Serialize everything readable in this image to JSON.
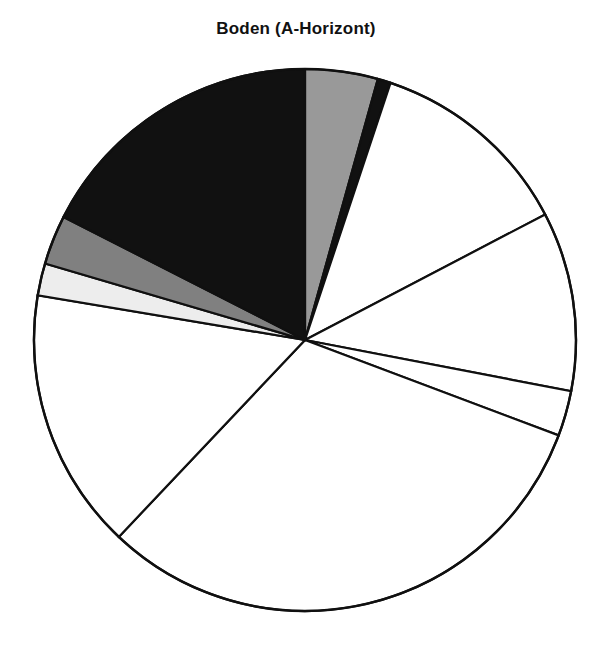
{
  "chart": {
    "title": "Boden (A-Horizont)"
  },
  "chart_data": {
    "type": "pie",
    "title": "Boden (A-Horizont)",
    "subtitle": "",
    "xlabel": "",
    "ylabel": "",
    "grid": false,
    "legend": "none",
    "start_angle_deg": 0,
    "direction": "clockwise",
    "center": [
      305,
      340
    ],
    "radius": 271,
    "total_degrees": 360,
    "slices": [
      {
        "index": 0,
        "label": "Segment 1",
        "color": "#999999",
        "start_deg": 0.0,
        "end_deg": 15.6,
        "sweep_deg": 15.6,
        "percent": 4.3
      },
      {
        "index": 1,
        "label": "Segment 2",
        "color": "#111111",
        "start_deg": 15.6,
        "end_deg": 18.4,
        "sweep_deg": 2.8,
        "percent": 0.8
      },
      {
        "index": 2,
        "label": "Segment 3",
        "color": "#ffffff",
        "start_deg": 18.4,
        "end_deg": 62.4,
        "sweep_deg": 44.0,
        "percent": 12.2
      },
      {
        "index": 3,
        "label": "Segment 4",
        "color": "#ffffff",
        "start_deg": 62.4,
        "end_deg": 100.9,
        "sweep_deg": 38.5,
        "percent": 10.7
      },
      {
        "index": 4,
        "label": "Segment 5",
        "color": "#ffffff",
        "start_deg": 100.9,
        "end_deg": 110.6,
        "sweep_deg": 9.7,
        "percent": 2.7
      },
      {
        "index": 5,
        "label": "Segment 6",
        "color": "#ffffff",
        "start_deg": 110.6,
        "end_deg": 223.4,
        "sweep_deg": 112.8,
        "percent": 31.3
      },
      {
        "index": 6,
        "label": "Segment 7",
        "color": "#ffffff",
        "start_deg": 223.4,
        "end_deg": 279.5,
        "sweep_deg": 56.1,
        "percent": 15.6
      },
      {
        "index": 7,
        "label": "Segment 8",
        "color": "#ededed",
        "start_deg": 279.5,
        "end_deg": 286.4,
        "sweep_deg": 6.9,
        "percent": 1.9
      },
      {
        "index": 8,
        "label": "Segment 9",
        "color": "#808080",
        "start_deg": 286.4,
        "end_deg": 297.0,
        "sweep_deg": 10.6,
        "percent": 2.9
      },
      {
        "index": 9,
        "label": "Segment 10",
        "color": "#111111",
        "start_deg": 297.0,
        "end_deg": 360.0,
        "sweep_deg": 63.0,
        "percent": 17.5
      }
    ]
  }
}
